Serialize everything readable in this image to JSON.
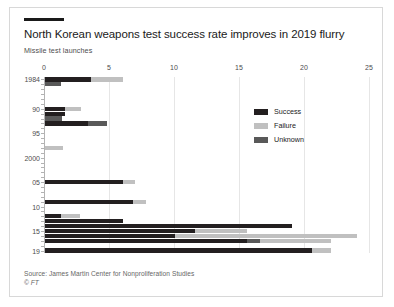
{
  "header": {
    "title": "North Korean weapons test success rate improves in 2019 flurry",
    "subtitle": "Missile test launches"
  },
  "footer": {
    "source": "Source: James Martin Center for Nonproliferation Studies",
    "copyright": "© FT"
  },
  "colors": {
    "success": "#231f20",
    "failure": "#c0c0c0",
    "unknown": "#595959",
    "grid": "#e6e6e6",
    "axis": "#b3b3b3",
    "border": "#d8d8d8",
    "text": "#1a1a1a"
  },
  "chart_data": {
    "type": "bar",
    "orientation": "horizontal",
    "stacked": true,
    "title": "North Korean weapons test success rate improves in 2019 flurry",
    "subtitle": "Missile test launches",
    "xlabel": "",
    "ylabel": "",
    "xlim": [
      0,
      25
    ],
    "xticks": [
      0,
      5,
      10,
      15,
      20,
      25
    ],
    "grid": true,
    "legend_position": "inside-right",
    "legend": [
      "Success",
      "Failure",
      "Unknown"
    ],
    "series": [
      {
        "name": "Success",
        "color": "#231f20"
      },
      {
        "name": "Failure",
        "color": "#c0c0c0"
      },
      {
        "name": "Unknown",
        "color": "#595959"
      }
    ],
    "categories": [
      "1984",
      "1985",
      "1986",
      "1987",
      "1988",
      "1989",
      "1990",
      "1991",
      "1992",
      "1993",
      "1994",
      "1995",
      "1996",
      "1997",
      "1998",
      "1999",
      "2000",
      "2001",
      "2002",
      "2003",
      "2004",
      "2005",
      "2006",
      "2007",
      "2008",
      "2009",
      "2010",
      "2011",
      "2012",
      "2013",
      "2014",
      "2015",
      "2016",
      "2017",
      "2018",
      "2019"
    ],
    "ytick_labels": [
      {
        "category": "1984",
        "label": "1984"
      },
      {
        "category": "1990",
        "label": "90"
      },
      {
        "category": "1995",
        "label": "95"
      },
      {
        "category": "2000",
        "label": "2000"
      },
      {
        "category": "2005",
        "label": "05"
      },
      {
        "category": "2010",
        "label": "10"
      },
      {
        "category": "2015",
        "label": "15"
      },
      {
        "category": "2019",
        "label": "19"
      }
    ],
    "rows": [
      {
        "year": "1984",
        "success": 3.5,
        "failure": 2.5,
        "unknown": 0
      },
      {
        "year": "1985",
        "success": 0,
        "failure": 0,
        "unknown": 1.2
      },
      {
        "year": "1986",
        "success": 0,
        "failure": 0,
        "unknown": 0
      },
      {
        "year": "1987",
        "success": 0,
        "failure": 0,
        "unknown": 0
      },
      {
        "year": "1988",
        "success": 0,
        "failure": 0,
        "unknown": 0
      },
      {
        "year": "1989",
        "success": 0,
        "failure": 0,
        "unknown": 0
      },
      {
        "year": "1990",
        "success": 1.5,
        "failure": 1.3,
        "unknown": 0
      },
      {
        "year": "1991",
        "success": 1.5,
        "failure": 0,
        "unknown": 0
      },
      {
        "year": "1992",
        "success": 0,
        "failure": 0,
        "unknown": 1.3
      },
      {
        "year": "1993",
        "success": 3.3,
        "failure": 0,
        "unknown": 1.5
      },
      {
        "year": "1994",
        "success": 0,
        "failure": 0,
        "unknown": 0
      },
      {
        "year": "1995",
        "success": 0,
        "failure": 0,
        "unknown": 0
      },
      {
        "year": "1996",
        "success": 0,
        "failure": 0,
        "unknown": 0
      },
      {
        "year": "1997",
        "success": 0,
        "failure": 0,
        "unknown": 0
      },
      {
        "year": "1998",
        "success": 0,
        "failure": 1.4,
        "unknown": 0
      },
      {
        "year": "1999",
        "success": 0,
        "failure": 0,
        "unknown": 0
      },
      {
        "year": "2000",
        "success": 0,
        "failure": 0,
        "unknown": 0
      },
      {
        "year": "2001",
        "success": 0,
        "failure": 0,
        "unknown": 0
      },
      {
        "year": "2002",
        "success": 0,
        "failure": 0,
        "unknown": 0
      },
      {
        "year": "2003",
        "success": 0,
        "failure": 0,
        "unknown": 0
      },
      {
        "year": "2004",
        "success": 0,
        "failure": 0,
        "unknown": 0
      },
      {
        "year": "2005",
        "success": 6.0,
        "failure": 0.9,
        "unknown": 0
      },
      {
        "year": "2006",
        "success": 0,
        "failure": 0,
        "unknown": 0
      },
      {
        "year": "2007",
        "success": 0,
        "failure": 0,
        "unknown": 0
      },
      {
        "year": "2008",
        "success": 0,
        "failure": 0,
        "unknown": 0
      },
      {
        "year": "2009",
        "success": 6.8,
        "failure": 1.0,
        "unknown": 0
      },
      {
        "year": "2010",
        "success": 0,
        "failure": 0,
        "unknown": 0
      },
      {
        "year": "2011",
        "success": 0,
        "failure": 0,
        "unknown": 0
      },
      {
        "year": "2012",
        "success": 1.2,
        "failure": 1.5,
        "unknown": 0
      },
      {
        "year": "2013",
        "success": 6.0,
        "failure": 0,
        "unknown": 0
      },
      {
        "year": "2014",
        "success": 19.0,
        "failure": 0,
        "unknown": 0
      },
      {
        "year": "2015",
        "success": 11.5,
        "failure": 4.0,
        "unknown": 0
      },
      {
        "year": "2016",
        "success": 10.0,
        "failure": 14.0,
        "unknown": 0
      },
      {
        "year": "2017",
        "success": 15.5,
        "failure": 5.5,
        "unknown": 1.0
      },
      {
        "year": "2018",
        "success": 0,
        "failure": 0,
        "unknown": 0
      },
      {
        "year": "2019",
        "success": 20.5,
        "failure": 1.5,
        "unknown": 0
      }
    ]
  }
}
